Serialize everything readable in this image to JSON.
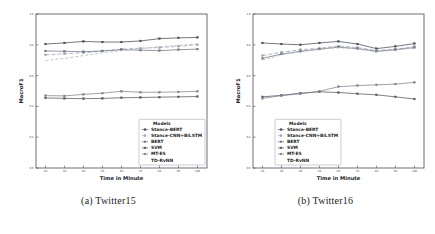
{
  "figure": {
    "subfigures": [
      {
        "caption": "(a) Twitter15",
        "caption_index": "(a)",
        "caption_name": "Twitter15"
      },
      {
        "caption": "(b) Twitter16",
        "caption_index": "(b)",
        "caption_name": "Twitter16"
      }
    ]
  },
  "legend": {
    "title": "Models",
    "entries": [
      {
        "label": "Stance-BERT",
        "color": "#4a4a58",
        "marker": "plus-dot",
        "dash": "none"
      },
      {
        "label": "Stance-CNN+BiLSTM",
        "color": "#9aa0ad",
        "marker": "dash",
        "dash": "4,2"
      },
      {
        "label": "BERT",
        "color": "#6f7682",
        "marker": "plus-dot",
        "dash": "none"
      },
      {
        "label": "SVM",
        "color": "#55555f",
        "marker": "plus-dot",
        "dash": "none"
      },
      {
        "label": "MT-ES",
        "color": "#7b828d",
        "marker": "plus-dot",
        "dash": "none"
      },
      {
        "label": "TD-RvNN",
        "color": "#aeb3bd",
        "marker": "none",
        "dash": "3,2"
      }
    ]
  },
  "chart_data": [
    {
      "type": "line",
      "title": "(a) Twitter15",
      "xlabel": "Time in Minute",
      "ylabel": "MacroF1",
      "x": [
        20,
        30,
        40,
        50,
        60,
        70,
        80,
        90,
        100
      ],
      "xticks": [
        20,
        30,
        40,
        50,
        60,
        70,
        80,
        90,
        100
      ],
      "yticks": [
        0.0,
        0.2,
        0.4,
        0.6,
        0.8,
        1.0
      ],
      "xlim": [
        15,
        105
      ],
      "ylim": [
        0.0,
        1.0
      ],
      "grid": false,
      "legend_position": "lower-right",
      "series": [
        {
          "name": "Stance-BERT",
          "values": [
            0.805,
            0.812,
            0.822,
            0.818,
            0.818,
            0.825,
            0.84,
            0.845,
            0.848
          ]
        },
        {
          "name": "Stance-CNN+BiLSTM",
          "values": [
            0.735,
            0.742,
            0.748,
            0.76,
            0.772,
            0.778,
            0.782,
            0.79,
            0.8
          ]
        },
        {
          "name": "BERT",
          "values": [
            0.76,
            0.758,
            0.755,
            0.76,
            0.768,
            0.765,
            0.762,
            0.768,
            0.772
          ]
        },
        {
          "name": "SVM",
          "values": [
            0.455,
            0.452,
            0.45,
            0.452,
            0.456,
            0.458,
            0.46,
            0.462,
            0.464
          ]
        },
        {
          "name": "MT-ES",
          "values": [
            0.47,
            0.468,
            0.478,
            0.486,
            0.498,
            0.492,
            0.492,
            0.494,
            0.498
          ]
        },
        {
          "name": "TD-RvNN",
          "values": [
            0.698,
            0.712,
            0.73,
            0.748,
            0.762,
            0.775,
            0.788,
            0.796,
            0.806
          ]
        }
      ]
    },
    {
      "type": "line",
      "title": "(b) Twitter16",
      "xlabel": "Time in Minute",
      "ylabel": "MacroF1",
      "x": [
        20,
        30,
        40,
        50,
        60,
        70,
        80,
        90,
        100
      ],
      "xticks": [
        20,
        30,
        40,
        50,
        60,
        70,
        80,
        90,
        100
      ],
      "yticks": [
        0.0,
        0.2,
        0.4,
        0.6,
        0.8,
        1.0
      ],
      "xlim": [
        15,
        105
      ],
      "ylim": [
        0.0,
        1.0
      ],
      "grid": false,
      "legend_position": "lower-center",
      "series": [
        {
          "name": "Stance-BERT",
          "values": [
            0.812,
            0.805,
            0.8,
            0.812,
            0.822,
            0.805,
            0.775,
            0.79,
            0.808
          ]
        },
        {
          "name": "Stance-CNN+BiLSTM",
          "values": [
            0.73,
            0.752,
            0.768,
            0.778,
            0.792,
            0.782,
            0.762,
            0.772,
            0.788
          ]
        },
        {
          "name": "BERT",
          "values": [
            0.712,
            0.74,
            0.758,
            0.772,
            0.785,
            0.775,
            0.758,
            0.768,
            0.782
          ]
        },
        {
          "name": "SVM",
          "values": [
            0.462,
            0.472,
            0.486,
            0.495,
            0.49,
            0.482,
            0.475,
            0.462,
            0.448
          ]
        },
        {
          "name": "MT-ES",
          "values": [
            0.452,
            0.47,
            0.482,
            0.498,
            0.528,
            0.535,
            0.54,
            0.545,
            0.556
          ]
        },
        {
          "name": "TD-RvNN",
          "values": [
            0.7,
            0.735,
            0.755,
            0.77,
            0.782,
            0.772,
            0.755,
            0.766,
            0.78
          ]
        }
      ]
    }
  ]
}
